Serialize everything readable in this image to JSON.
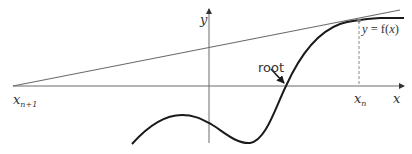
{
  "diagram": {
    "labels": {
      "y_axis": "y",
      "x_axis": "x",
      "x_n_base": "x",
      "x_n_sub": "n",
      "x_n1_base": "x",
      "x_n1_sub": "n+1",
      "curve_label_y": "y",
      "curve_label_eq": " = f(",
      "curve_label_x": "x",
      "curve_label_close": ")",
      "root": "root"
    },
    "colors": {
      "axis": "#6a6a6a",
      "curve": "#1a1a1a",
      "tangent": "#6a6a6a",
      "text": "#333333",
      "background": "#ffffff"
    }
  }
}
